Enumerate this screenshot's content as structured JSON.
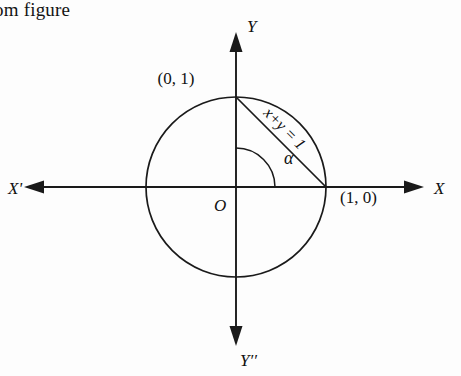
{
  "caption": {
    "text": "om figure"
  },
  "figure": {
    "background_color": "#fdfdfd",
    "stroke_color": "#1a1a1a",
    "origin": {
      "x": 236,
      "y": 187,
      "label": "O"
    },
    "radius_px": 90,
    "axes": {
      "x_positive_label": "X",
      "x_negative_label": "X'",
      "y_positive_label": "Y",
      "y_negative_label": "Y′′"
    },
    "points": [
      {
        "name": "top-intercept",
        "label": "(0, 1)",
        "x": 236,
        "y": 97
      },
      {
        "name": "right-intercept",
        "label": "(1, 0)",
        "x": 326,
        "y": 187
      }
    ],
    "chord": {
      "label": "x+y = 1",
      "from": "(0, 1)",
      "to": "(1, 0)",
      "rotation_deg": 45
    },
    "angle": {
      "label": "α",
      "vertex": "O",
      "from_ray": "Y",
      "to_ray": "X",
      "measure_deg": 90
    }
  }
}
